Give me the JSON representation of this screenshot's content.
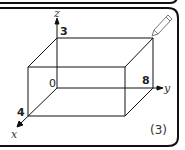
{
  "diagram": {
    "axes": {
      "x_label": "x",
      "y_label": "y",
      "z_label": "z",
      "origin_label": "0"
    },
    "dimensions": {
      "x_extent": "4",
      "y_extent": "8",
      "z_extent": "3"
    },
    "problem_number": "(3)",
    "edit_icon": "pencil-icon"
  }
}
